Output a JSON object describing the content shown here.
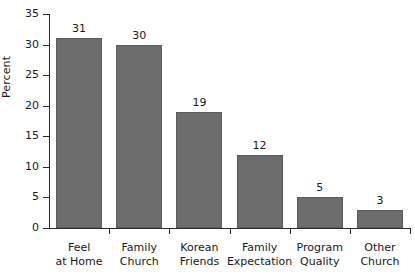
{
  "chart_data": {
    "type": "bar",
    "title": "",
    "xlabel": "",
    "ylabel": "Percent",
    "categories": [
      "Feel\nat Home",
      "Family\nChurch",
      "Korean\nFriends",
      "Family\nExpectation",
      "Program\nQuality",
      "Other\nChurch"
    ],
    "values": [
      31,
      30,
      19,
      12,
      5,
      3
    ],
    "value_labels": [
      "31",
      "30",
      "19",
      "12",
      "5",
      "3"
    ],
    "ylim": [
      0,
      35
    ],
    "ytick_labels": [
      "0",
      "5",
      "10",
      "15",
      "20",
      "25",
      "30",
      "35"
    ],
    "ytick_values": [
      0,
      5,
      10,
      15,
      20,
      25,
      30,
      35
    ],
    "grid": false,
    "legend": null,
    "bar_color": "#6d6d6d",
    "axis_color": "#2b2b2b",
    "background": "#ffffff"
  },
  "axis": {
    "y_title": "Percent"
  }
}
